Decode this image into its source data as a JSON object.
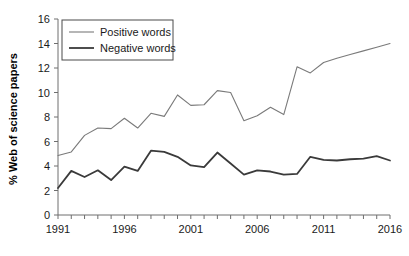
{
  "chart_data": {
    "type": "line",
    "title": "",
    "xlabel": "",
    "ylabel": "% Web of science papers",
    "xlim": [
      1991,
      2016
    ],
    "ylim": [
      0,
      16
    ],
    "ytick_step": 2,
    "xtick_step": 1,
    "xtick_label_step": 5,
    "grid": false,
    "legend_position": "top-left",
    "yticks": [
      "0",
      "2",
      "4",
      "6",
      "8",
      "10",
      "12",
      "14",
      "16"
    ],
    "xticks_labeled": [
      "1991",
      "1996",
      "2001",
      "2006",
      "2011",
      "2016"
    ],
    "x": [
      1991,
      1992,
      1993,
      1994,
      1995,
      1996,
      1997,
      1998,
      1999,
      2000,
      2001,
      2002,
      2003,
      2004,
      2005,
      2006,
      2007,
      2008,
      2009,
      2010,
      2011,
      2012,
      2013,
      2014,
      2015,
      2016
    ],
    "series": [
      {
        "name": "Positive words",
        "color": "#7a7a7a",
        "width": 1.1,
        "values": [
          4.85,
          5.15,
          6.5,
          7.1,
          7.05,
          7.9,
          7.1,
          8.3,
          8.05,
          9.8,
          8.95,
          9.0,
          10.15,
          10.0,
          7.7,
          8.1,
          8.8,
          8.2,
          12.1,
          11.6,
          12.45,
          12.8,
          13.1,
          13.4,
          13.7,
          14.0
        ]
      },
      {
        "name": "Negative words",
        "color": "#3a3a3a",
        "width": 1.8,
        "values": [
          2.2,
          3.6,
          3.1,
          3.65,
          2.85,
          3.95,
          3.6,
          5.25,
          5.15,
          4.75,
          4.05,
          3.9,
          5.1,
          4.2,
          3.3,
          3.65,
          3.55,
          3.3,
          3.35,
          4.75,
          4.5,
          4.45,
          4.55,
          4.6,
          4.8,
          4.45
        ]
      }
    ]
  },
  "legend": {
    "items": [
      {
        "label": "Positive words"
      },
      {
        "label": "Negative words"
      }
    ]
  },
  "axes": {
    "y_title": "% Web of science papers"
  }
}
